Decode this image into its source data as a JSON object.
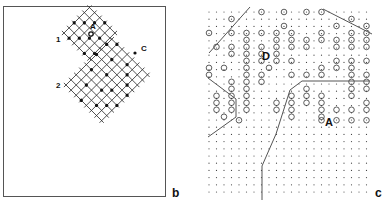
{
  "figure": {
    "panels": [
      {
        "id": "b",
        "label": "b",
        "lattice_labels": [
          "1",
          "2"
        ],
        "site_labels": [
          "A",
          "C"
        ]
      },
      {
        "id": "c",
        "label": "c",
        "site_labels": [
          "D",
          "A"
        ]
      }
    ]
  }
}
